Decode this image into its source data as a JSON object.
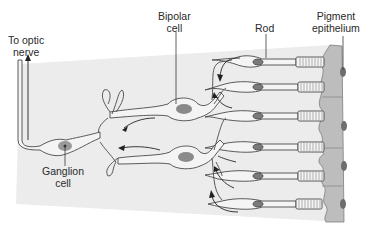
{
  "diagram": {
    "labels": {
      "optic_nerve": [
        "To optic",
        "nerve"
      ],
      "bipolar": [
        "Bipolar",
        "cell"
      ],
      "rod": [
        "Rod"
      ],
      "pigment": [
        "Pigment",
        "epithelium"
      ],
      "ganglion": [
        "Ganglion",
        "cell"
      ]
    },
    "colors": {
      "panel": "#ececec",
      "cell_fill": "#f4f4f4",
      "outline": "#4a4a4a",
      "nucleus": "#7a7a7a",
      "epithelium": "#bdbdbd",
      "epithelium_nucleus": "#6e6e6e",
      "text": "#2a2a2a"
    },
    "rods": [
      {
        "y": 62
      },
      {
        "y": 87
      },
      {
        "y": 116
      },
      {
        "y": 147
      },
      {
        "y": 176
      },
      {
        "y": 204
      }
    ],
    "epithelium_nuclei": [
      {
        "y": 72
      },
      {
        "y": 126
      },
      {
        "y": 166
      },
      {
        "y": 204
      }
    ]
  }
}
